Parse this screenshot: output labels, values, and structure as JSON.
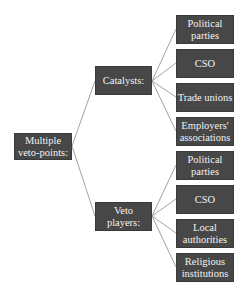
{
  "diagram": {
    "root": {
      "label": "Multiple\nveto-points:"
    },
    "branches": [
      {
        "label": "Catalysts:",
        "children": [
          {
            "label": "Political\nparties"
          },
          {
            "label": "CSO"
          },
          {
            "label": "Trade unions"
          },
          {
            "label": "Employers'\nassociations"
          }
        ]
      },
      {
        "label": "Veto players:",
        "children": [
          {
            "label": "Political\nparties"
          },
          {
            "label": "CSO"
          },
          {
            "label": "Local\nauthorities"
          },
          {
            "label": "Religious\ninstitutions"
          }
        ]
      }
    ],
    "colors": {
      "box_fill": "#474747",
      "box_text": "#f2f2f2",
      "connector": "#8a8a8a"
    }
  }
}
